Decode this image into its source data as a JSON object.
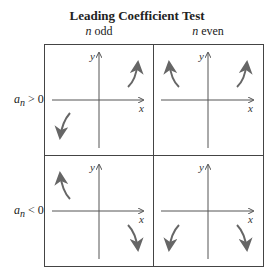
{
  "title": "Leading Coefficient Test",
  "columns": [
    {
      "var": "n",
      "label": "odd"
    },
    {
      "var": "n",
      "label": "even"
    }
  ],
  "rows": [
    {
      "coef": "a",
      "sub": "n",
      "relation": "> 0"
    },
    {
      "coef": "a",
      "sub": "n",
      "relation": "< 0"
    }
  ],
  "axes": {
    "x_label": "x",
    "y_label": "y"
  },
  "panels": [
    {
      "row": "a_n > 0",
      "col": "n odd",
      "left_end": "falls",
      "right_end": "rises"
    },
    {
      "row": "a_n > 0",
      "col": "n even",
      "left_end": "rises",
      "right_end": "rises"
    },
    {
      "row": "a_n < 0",
      "col": "n odd",
      "left_end": "rises",
      "right_end": "falls"
    },
    {
      "row": "a_n < 0",
      "col": "n even",
      "left_end": "falls",
      "right_end": "falls"
    }
  ],
  "colors": {
    "line": "#555555",
    "arrow": "#666666",
    "border": "#444444"
  }
}
